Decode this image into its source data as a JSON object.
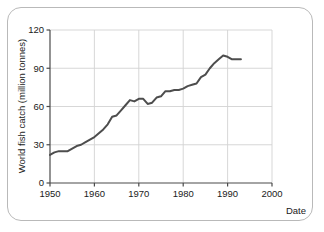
{
  "figure": {
    "background_color": "#ffffff",
    "border_color": "#b9b9b9",
    "line_color": "#4d4d4d",
    "grid_color": "#d2d2d2",
    "axis_color": "#4a4a4a"
  },
  "chart_data": {
    "type": "line",
    "title": "",
    "xlabel": "Date",
    "ylabel": "World fish catch (million tonnes)",
    "xlim": [
      1950,
      2000
    ],
    "ylim": [
      0,
      120
    ],
    "xticks": [
      1950,
      1960,
      1970,
      1980,
      1990,
      2000
    ],
    "xtick_labels": [
      "1950",
      "1960",
      "1970",
      "1980",
      "1990",
      "2000"
    ],
    "yticks": [
      0,
      30,
      60,
      90,
      120
    ],
    "ytick_labels": [
      "0",
      "30",
      "60",
      "90",
      "120"
    ],
    "grid": "both",
    "legend": "none",
    "series": [
      {
        "name": "World fish catch",
        "x": [
          1950,
          1951,
          1952,
          1953,
          1954,
          1955,
          1956,
          1957,
          1958,
          1959,
          1960,
          1961,
          1962,
          1963,
          1964,
          1965,
          1966,
          1967,
          1968,
          1969,
          1970,
          1971,
          1972,
          1973,
          1974,
          1975,
          1976,
          1977,
          1978,
          1979,
          1980,
          1981,
          1982,
          1983,
          1984,
          1985,
          1986,
          1987,
          1988,
          1989,
          1990,
          1991,
          1992,
          1993
        ],
        "values": [
          22,
          24,
          25,
          25,
          25,
          27,
          29,
          30,
          32,
          34,
          36,
          39,
          42,
          46,
          52,
          53,
          57,
          61,
          65,
          64,
          66,
          66,
          62,
          63,
          67,
          68,
          72,
          72,
          73,
          73,
          74,
          76,
          77,
          78,
          83,
          85,
          90,
          94,
          97,
          100,
          99,
          97,
          97,
          97
        ]
      }
    ]
  },
  "axis_titles": {
    "x": "Date",
    "y": "World fish catch (million tonnes)"
  }
}
